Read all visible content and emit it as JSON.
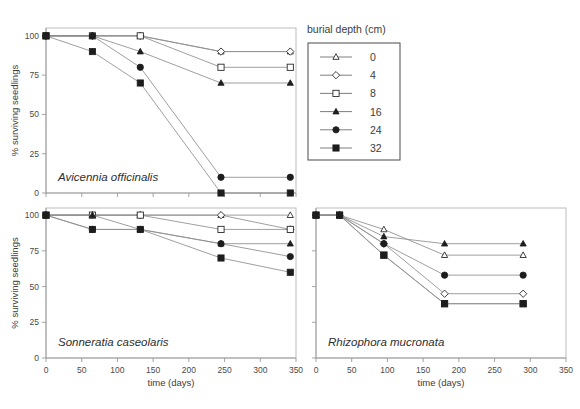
{
  "figure": {
    "y_axis_label": "% surviving seedlings",
    "x_axis_label": "time (days)",
    "y_ticks": [
      "0",
      "25",
      "50",
      "75",
      "100"
    ],
    "x_ticks": [
      "0",
      "50",
      "100",
      "150",
      "200",
      "250",
      "300",
      "350"
    ],
    "legend_title": "burial depth (cm)"
  },
  "legend": {
    "title": "burial depth (cm)",
    "entries": [
      {
        "label": "0",
        "marker": "open-triangle-icon"
      },
      {
        "label": "4",
        "marker": "open-diamond-icon"
      },
      {
        "label": "8",
        "marker": "open-square-icon"
      },
      {
        "label": "16",
        "marker": "filled-triangle-icon"
      },
      {
        "label": "24",
        "marker": "filled-circle-icon"
      },
      {
        "label": "32",
        "marker": "filled-square-icon"
      }
    ]
  },
  "panels": [
    {
      "id": "avicennia",
      "species": "Avicennia officinalis",
      "show_x_labels": false,
      "show_y_labels": true
    },
    {
      "id": "sonneratia",
      "species": "Sonneratia caseolaris",
      "show_x_labels": true,
      "show_y_labels": true
    },
    {
      "id": "rhizophora",
      "species": "Rhizophora mucronata",
      "show_x_labels": true,
      "show_y_labels": false
    }
  ],
  "chart_data": [
    {
      "type": "line",
      "title": "Avicennia officinalis",
      "xlabel": "time (days)",
      "ylabel": "% surviving seedlings",
      "xlim": [
        0,
        350
      ],
      "ylim": [
        0,
        105
      ],
      "grid": false,
      "legend_position": "right-outside",
      "legend_title": "burial depth (cm)",
      "x": [
        0,
        65,
        132,
        245,
        342
      ],
      "series": [
        {
          "name": "0",
          "marker": "open-triangle",
          "values": [
            100,
            100,
            100,
            90,
            90
          ]
        },
        {
          "name": "4",
          "marker": "open-diamond",
          "values": [
            100,
            100,
            100,
            90,
            90
          ]
        },
        {
          "name": "8",
          "marker": "open-square",
          "values": [
            100,
            100,
            100,
            80,
            80
          ]
        },
        {
          "name": "16",
          "marker": "filled-triangle",
          "values": [
            100,
            100,
            90,
            70,
            70
          ]
        },
        {
          "name": "24",
          "marker": "filled-circle",
          "values": [
            100,
            100,
            80,
            10,
            10
          ]
        },
        {
          "name": "32",
          "marker": "filled-square",
          "values": [
            100,
            90,
            70,
            0,
            0
          ]
        }
      ]
    },
    {
      "type": "line",
      "title": "Sonneratia caseolaris",
      "xlabel": "time (days)",
      "ylabel": "% surviving seedlings",
      "xlim": [
        0,
        350
      ],
      "ylim": [
        0,
        105
      ],
      "grid": false,
      "legend_position": "right-outside",
      "legend_title": "burial depth (cm)",
      "x": [
        0,
        65,
        132,
        245,
        342
      ],
      "series": [
        {
          "name": "0",
          "marker": "open-triangle",
          "values": [
            100,
            100,
            100,
            100,
            100
          ]
        },
        {
          "name": "4",
          "marker": "open-diamond",
          "values": [
            100,
            100,
            100,
            100,
            90
          ]
        },
        {
          "name": "8",
          "marker": "open-square",
          "values": [
            100,
            100,
            100,
            90,
            90
          ]
        },
        {
          "name": "16",
          "marker": "filled-triangle",
          "values": [
            100,
            100,
            90,
            80,
            80
          ]
        },
        {
          "name": "24",
          "marker": "filled-circle",
          "values": [
            100,
            90,
            90,
            80,
            71
          ]
        },
        {
          "name": "32",
          "marker": "filled-square",
          "values": [
            100,
            90,
            90,
            70,
            60
          ]
        }
      ]
    },
    {
      "type": "line",
      "title": "Rhizophora mucronata",
      "xlabel": "time (days)",
      "ylabel": "% surviving seedlings",
      "xlim": [
        0,
        350
      ],
      "ylim": [
        0,
        105
      ],
      "grid": false,
      "legend_position": "right-outside",
      "legend_title": "burial depth (cm)",
      "x": [
        0,
        33,
        95,
        180,
        290
      ],
      "series": [
        {
          "name": "0",
          "marker": "open-triangle",
          "values": [
            100,
            100,
            90,
            72,
            72
          ]
        },
        {
          "name": "4",
          "marker": "open-diamond",
          "values": [
            100,
            100,
            80,
            45,
            45
          ]
        },
        {
          "name": "8",
          "marker": "open-square",
          "values": [
            100,
            100,
            72,
            38,
            38
          ]
        },
        {
          "name": "16",
          "marker": "filled-triangle",
          "values": [
            100,
            100,
            85,
            80,
            80
          ]
        },
        {
          "name": "24",
          "marker": "filled-circle",
          "values": [
            100,
            100,
            80,
            58,
            58
          ]
        },
        {
          "name": "32",
          "marker": "filled-square",
          "values": [
            100,
            100,
            72,
            38,
            38
          ]
        }
      ]
    }
  ]
}
